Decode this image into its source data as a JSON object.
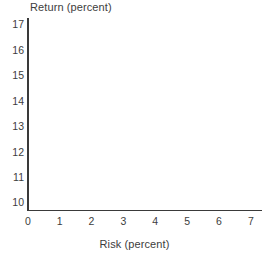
{
  "chart_data": {
    "type": "scatter",
    "title": "",
    "xlabel": "Risk (percent)",
    "ylabel": "Return (percent)",
    "xlim": [
      0,
      7.35
    ],
    "ylim": [
      9.7,
      17.25
    ],
    "xticks": [
      0,
      1,
      2,
      3,
      4,
      5,
      6,
      7
    ],
    "xtick_labels": [
      "0",
      "1",
      "2",
      "3",
      "4",
      "5",
      "6",
      "7"
    ],
    "yticks": [
      10,
      11,
      12,
      13,
      14,
      15,
      16,
      17
    ],
    "ytick_labels": [
      "10",
      "11",
      "12",
      "13",
      "14",
      "15",
      "16",
      "17"
    ],
    "grid": false,
    "legend": null,
    "series": [],
    "annotations": [],
    "note": "Empty plot frame: axes drawn with labelled ticks but no data points, lines, or markers rendered inside the plot area.",
    "colors": {
      "axis": "#3a3a3a",
      "text": "#3d3d3d",
      "background": "#ffffff"
    }
  }
}
